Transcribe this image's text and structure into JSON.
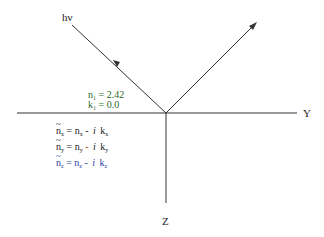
{
  "labels": {
    "incident": "hν",
    "y_axis": "Y",
    "z_axis": "Z"
  },
  "medium1": {
    "n_line": "n₁ = 2.42",
    "k_line": "k₁ = 0.0",
    "n_sym": "n",
    "n_sub": "1",
    "n_eq": "= 2.42",
    "k_sym": "k",
    "k_sub": "1",
    "k_eq": "= 0.0"
  },
  "medium2": {
    "equations": [
      {
        "axis": "x",
        "lhs": "n",
        "sub": "x",
        "eq": "= n",
        "minus": "-",
        "i": "i",
        "k": "k"
      },
      {
        "axis": "y",
        "lhs": "n",
        "sub": "y",
        "eq": "= n",
        "minus": "-",
        "i": "i",
        "k": "k"
      },
      {
        "axis": "z",
        "lhs": "n",
        "sub": "z",
        "eq": "= n",
        "minus": "-",
        "i": "i",
        "k": "k"
      }
    ]
  },
  "colors": {
    "line": "#333333",
    "medium1_text": "#2a6b2a",
    "minus_y": "#c0392b",
    "eq_z": "#2c3e9e"
  }
}
